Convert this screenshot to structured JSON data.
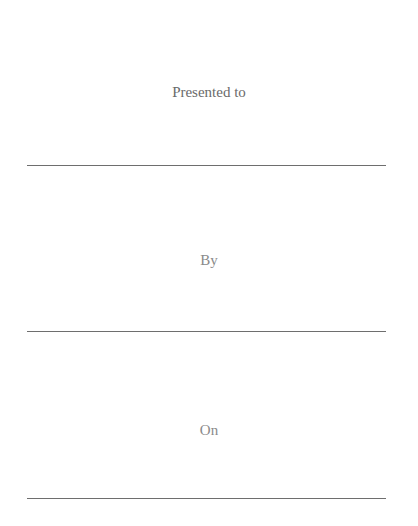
{
  "certificate": {
    "fields": [
      {
        "label": "Presented to",
        "value": ""
      },
      {
        "label": "By",
        "value": ""
      },
      {
        "label": "On",
        "value": ""
      }
    ]
  }
}
